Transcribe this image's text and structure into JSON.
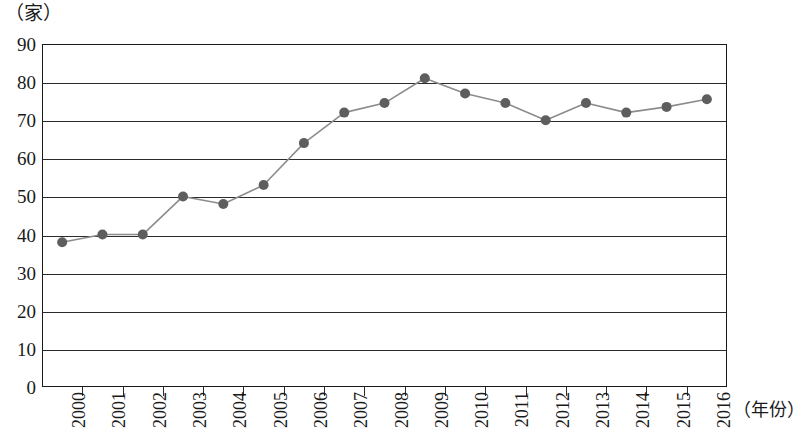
{
  "chart_data": {
    "type": "line",
    "title": "",
    "subtitle": "",
    "xlabel": "（年份）",
    "ylabel": "（家）",
    "y_unit_caption": "（家）",
    "x_unit_caption": "（年份）",
    "categories": [
      "2000",
      "2001",
      "2002",
      "2003",
      "2004",
      "2005",
      "2006",
      "2007",
      "2008",
      "2009",
      "2010",
      "2011",
      "2012",
      "2013",
      "2014",
      "2015",
      "2016"
    ],
    "values": [
      38,
      40,
      40,
      50,
      48,
      53,
      64,
      72,
      74.5,
      81,
      77,
      74.5,
      70,
      74.5,
      72,
      73.5,
      75.5
    ],
    "series": [
      {
        "name": "家数",
        "values": [
          38,
          40,
          40,
          50,
          48,
          53,
          64,
          72,
          74.5,
          81,
          77,
          74.5,
          70,
          74.5,
          72,
          73.5,
          75.5
        ]
      }
    ],
    "ylim": [
      0,
      90
    ],
    "y_ticks": [
      0,
      10,
      20,
      30,
      40,
      50,
      60,
      70,
      80,
      90
    ],
    "y_tick_labels": [
      "0",
      "10",
      "20",
      "30",
      "40",
      "50",
      "60",
      "70",
      "80",
      "90"
    ],
    "x_tick_labels": [
      "2000",
      "2001",
      "2002",
      "2003",
      "2004",
      "2005",
      "2006",
      "2007",
      "2008",
      "2009",
      "2010",
      "2011",
      "2012",
      "2013",
      "2014",
      "2015",
      "2016"
    ],
    "grid": true,
    "grid_axis": "y",
    "legend": false,
    "legend_position": "none",
    "markers": "filled-circle",
    "line_color": "#8c8c8c",
    "marker_color": "#5e5e5e",
    "axis_color": "#1a1a1a",
    "background_color": "#ffffff"
  }
}
